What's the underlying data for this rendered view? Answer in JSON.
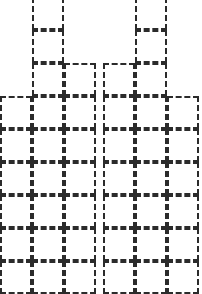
{
  "figure": {
    "background_color": "#ffffff",
    "stroke_color": "#2b2b2b",
    "stroke_width_px": 2,
    "stroke_style": "dashed",
    "canvas_width_px": 202,
    "canvas_height_px": 294
  },
  "chart_data": {
    "type": "bar",
    "subtitle": "",
    "xlabel": "",
    "ylabel": "",
    "unit": "cell",
    "categories": [
      "C1",
      "C2",
      "C3",
      "C4",
      "C5",
      "C6"
    ],
    "values": [
      6,
      9,
      7,
      7,
      9,
      6
    ],
    "ylim": [
      0,
      9
    ],
    "grid": false,
    "legend": "none",
    "annotations": []
  },
  "layout": {
    "cell_width_px": 32,
    "cell_height_px": 33,
    "group_gap_px": 6,
    "groups": [
      {
        "name": "left-block",
        "origin_x_px": 0,
        "columns": [
          {
            "name": "column-1",
            "cells": 6
          },
          {
            "name": "column-2",
            "cells": 9
          },
          {
            "name": "column-3",
            "cells": 7
          }
        ]
      },
      {
        "name": "right-block",
        "origin_x_px": 103,
        "columns": [
          {
            "name": "column-4",
            "cells": 7
          },
          {
            "name": "column-5",
            "cells": 9
          },
          {
            "name": "column-6",
            "cells": 6
          }
        ]
      }
    ]
  }
}
